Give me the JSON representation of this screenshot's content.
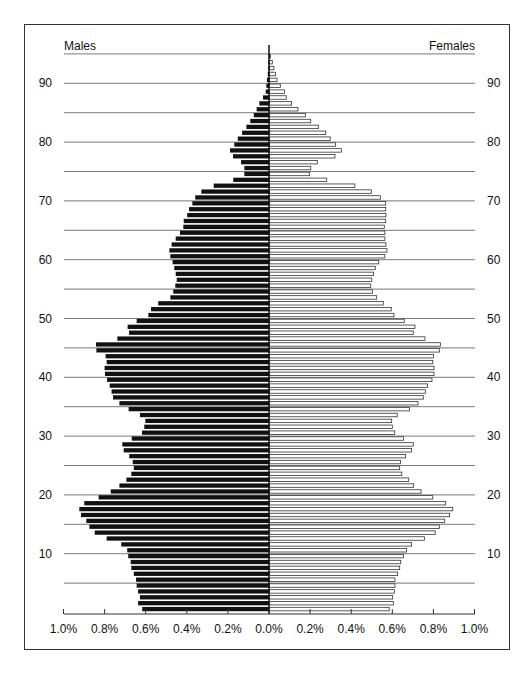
{
  "chart_data": {
    "type": "bar",
    "subtype": "population-pyramid",
    "title": "",
    "xlabel": "",
    "ylabel": "",
    "legend": {
      "left": "Males",
      "right": "Females"
    },
    "x_tick_labels": [
      "1.0%",
      "0.8%",
      "0.6%",
      "0.4%",
      "0.2%",
      "0.0%",
      "0.2%",
      "0.4%",
      "0.6%",
      "0.8%",
      "1.0%"
    ],
    "x_ticks_pct": [
      -1.0,
      -0.8,
      -0.6,
      -0.4,
      -0.2,
      0.0,
      0.2,
      0.4,
      0.6,
      0.8,
      1.0
    ],
    "xlim": [
      -1.0,
      1.0
    ],
    "y_tick_labels": [
      "10",
      "20",
      "30",
      "40",
      "50",
      "60",
      "70",
      "80",
      "90"
    ],
    "y_ticks": [
      10,
      20,
      30,
      40,
      50,
      60,
      70,
      80,
      90
    ],
    "gridlines_at_age": [
      5,
      10,
      15,
      20,
      25,
      30,
      35,
      40,
      45,
      50,
      55,
      60,
      65,
      70,
      75,
      80,
      85,
      90,
      95
    ],
    "ylim": [
      0,
      95
    ],
    "grid": true,
    "ages": [
      0,
      1,
      2,
      3,
      4,
      5,
      6,
      7,
      8,
      9,
      10,
      11,
      12,
      13,
      14,
      15,
      16,
      17,
      18,
      19,
      20,
      21,
      22,
      23,
      24,
      25,
      26,
      27,
      28,
      29,
      30,
      31,
      32,
      33,
      34,
      35,
      36,
      37,
      38,
      39,
      40,
      41,
      42,
      43,
      44,
      45,
      46,
      47,
      48,
      49,
      50,
      51,
      52,
      53,
      54,
      55,
      56,
      57,
      58,
      59,
      60,
      61,
      62,
      63,
      64,
      65,
      66,
      67,
      68,
      69,
      70,
      71,
      72,
      73,
      74,
      75,
      76,
      77,
      78,
      79,
      80,
      81,
      82,
      83,
      84,
      85,
      86,
      87,
      88,
      89,
      90,
      91,
      92,
      93,
      94
    ],
    "series": [
      {
        "name": "Males",
        "color": "#111111",
        "values": [
          0.617,
          0.637,
          0.628,
          0.637,
          0.644,
          0.647,
          0.658,
          0.67,
          0.673,
          0.685,
          0.69,
          0.719,
          0.79,
          0.848,
          0.874,
          0.889,
          0.915,
          0.923,
          0.899,
          0.829,
          0.77,
          0.728,
          0.694,
          0.67,
          0.658,
          0.663,
          0.68,
          0.707,
          0.714,
          0.668,
          0.618,
          0.607,
          0.602,
          0.628,
          0.683,
          0.728,
          0.759,
          0.766,
          0.775,
          0.788,
          0.798,
          0.8,
          0.79,
          0.795,
          0.84,
          0.842,
          0.738,
          0.681,
          0.688,
          0.644,
          0.587,
          0.574,
          0.539,
          0.48,
          0.466,
          0.456,
          0.449,
          0.454,
          0.461,
          0.469,
          0.48,
          0.485,
          0.474,
          0.454,
          0.433,
          0.417,
          0.415,
          0.398,
          0.389,
          0.373,
          0.359,
          0.329,
          0.269,
          0.174,
          0.12,
          0.12,
          0.136,
          0.175,
          0.19,
          0.169,
          0.152,
          0.131,
          0.11,
          0.091,
          0.074,
          0.06,
          0.047,
          0.029,
          0.016,
          0.013,
          0.01,
          0.006,
          0.004,
          0.003,
          0.002
        ]
      },
      {
        "name": "Females",
        "color": "#ffffff",
        "values": [
          0.585,
          0.605,
          0.602,
          0.61,
          0.613,
          0.613,
          0.626,
          0.636,
          0.641,
          0.654,
          0.67,
          0.694,
          0.756,
          0.809,
          0.829,
          0.855,
          0.879,
          0.894,
          0.86,
          0.797,
          0.74,
          0.704,
          0.68,
          0.646,
          0.636,
          0.64,
          0.665,
          0.693,
          0.702,
          0.654,
          0.612,
          0.6,
          0.597,
          0.624,
          0.683,
          0.725,
          0.751,
          0.761,
          0.772,
          0.793,
          0.803,
          0.803,
          0.797,
          0.8,
          0.829,
          0.834,
          0.759,
          0.702,
          0.71,
          0.658,
          0.608,
          0.595,
          0.556,
          0.524,
          0.503,
          0.495,
          0.5,
          0.508,
          0.517,
          0.534,
          0.564,
          0.574,
          0.569,
          0.564,
          0.564,
          0.561,
          0.568,
          0.569,
          0.568,
          0.568,
          0.543,
          0.498,
          0.418,
          0.281,
          0.198,
          0.203,
          0.235,
          0.321,
          0.352,
          0.324,
          0.298,
          0.276,
          0.24,
          0.203,
          0.178,
          0.141,
          0.11,
          0.084,
          0.075,
          0.055,
          0.039,
          0.032,
          0.024,
          0.016,
          0.007
        ]
      }
    ]
  },
  "layout": {
    "center_x": 269,
    "px_per_pct": 205.5,
    "age0_bottom_y": 612,
    "px_per_year": 5.88,
    "grid_left_x": 64,
    "grid_right_x": 475,
    "axis_y": 614
  }
}
